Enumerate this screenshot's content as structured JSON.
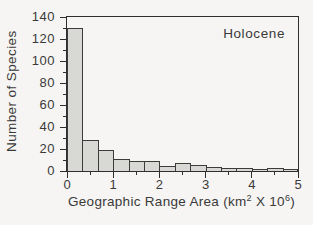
{
  "chart_data": {
    "type": "bar",
    "subtype": "histogram",
    "annotation": "Holocene",
    "ylabel": "Number of Species",
    "xlabel": "Geographic Range Area (km² X 10⁶)",
    "xlabel_parts": {
      "pre": "Geographic Range Area (km",
      "sup1": "2",
      "mid": " X 10",
      "sup2": "6",
      "post": ")"
    },
    "xlim": [
      0,
      5
    ],
    "ylim": [
      0,
      140
    ],
    "y_major_ticks": [
      0,
      20,
      40,
      60,
      80,
      100,
      120,
      140
    ],
    "y_minor_ticks": [
      10,
      30,
      50,
      70,
      90,
      110,
      130
    ],
    "x_major_ticks": [
      0,
      1,
      2,
      3,
      4,
      5
    ],
    "x_minor_ticks": [
      0.5,
      1.5,
      2.5,
      3.5,
      4.5
    ],
    "bin_edges": [
      0,
      0.333,
      0.667,
      1.0,
      1.333,
      1.667,
      2.0,
      2.333,
      2.667,
      3.0,
      3.333,
      3.667,
      4.0,
      4.333,
      4.667,
      5.0
    ],
    "counts": [
      129,
      27,
      18,
      10,
      8,
      8,
      4,
      6,
      5,
      3,
      2,
      2,
      1,
      2,
      1
    ],
    "grid": false,
    "legend": false,
    "colors": {
      "bar_fill": "#d8d8d5",
      "bar_stroke": "#3c3c3c",
      "axis": "#2e2e2e",
      "text": "#3a3a3a",
      "background": "#f6f5f3"
    }
  }
}
